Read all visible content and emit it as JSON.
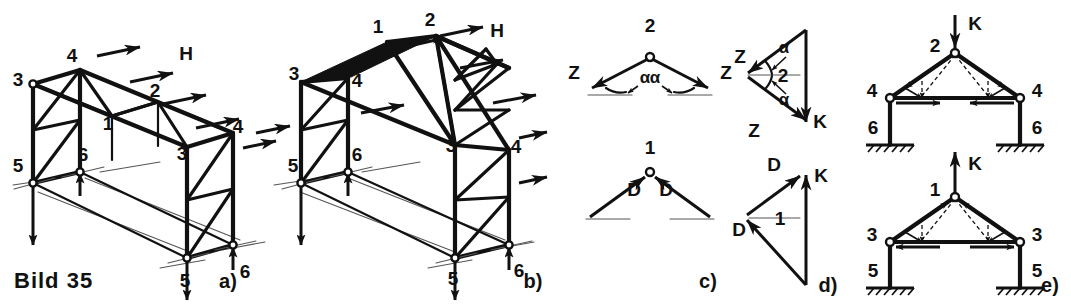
{
  "figure": {
    "caption": "Bild 35",
    "panel_labels": {
      "a": "a)",
      "b": "b)",
      "c": "c)",
      "d": "d)",
      "e": "e)"
    }
  },
  "panel_a": {
    "title": "Raeumliches Fachwerk mit Flachdach, Windlast H",
    "wind_label": "H",
    "node_labels": [
      {
        "text": "3",
        "x": 18,
        "y": 86
      },
      {
        "text": "4",
        "x": 72,
        "y": 62
      },
      {
        "text": "2",
        "x": 155,
        "y": 97
      },
      {
        "text": "1",
        "x": 108,
        "y": 130
      },
      {
        "text": "4",
        "x": 238,
        "y": 133
      },
      {
        "text": "3",
        "x": 182,
        "y": 160
      },
      {
        "text": "5",
        "x": 18,
        "y": 172
      },
      {
        "text": "6",
        "x": 83,
        "y": 161
      },
      {
        "text": "5",
        "x": 185,
        "y": 287
      },
      {
        "text": "6",
        "x": 245,
        "y": 278
      }
    ]
  },
  "panel_b": {
    "title": "Raeumliches Fachwerk mit Satteldach, Windlast H",
    "wind_label": "H",
    "node_labels": [
      {
        "text": "1",
        "x": 378,
        "y": 33
      },
      {
        "text": "2",
        "x": 430,
        "y": 26
      },
      {
        "text": "3",
        "x": 294,
        "y": 80
      },
      {
        "text": "4",
        "x": 357,
        "y": 87
      },
      {
        "text": "3",
        "x": 451,
        "y": 152
      },
      {
        "text": "4",
        "x": 513,
        "y": 153
      },
      {
        "text": "5",
        "x": 293,
        "y": 172
      },
      {
        "text": "6",
        "x": 357,
        "y": 161
      },
      {
        "text": "5",
        "x": 453,
        "y": 285
      },
      {
        "text": "6",
        "x": 516,
        "y": 277
      }
    ]
  },
  "panel_c": {
    "title": "Kraefte am Knoten",
    "top": {
      "node": "2",
      "force_left": "Z",
      "force_right": "Z",
      "angle_left": "α",
      "angle_right": "α"
    },
    "bottom": {
      "node": "1",
      "force_left": "D",
      "force_right": "D"
    }
  },
  "panel_d": {
    "title": "Krafteck",
    "top": {
      "force_z_upper": "Z",
      "force_z_lower": "Z",
      "load": "K",
      "angle_upper": "α",
      "angle_lower": "α",
      "inner_label": "2"
    },
    "bottom": {
      "force_d_upper": "D",
      "force_d_lower": "D",
      "load": "K",
      "inner_label": "1"
    }
  },
  "panel_e": {
    "title": "Ebener Rahmen, Kraft K am First",
    "top_frame": {
      "load": "K",
      "apex": "2",
      "eave_left": "4",
      "eave_right": "4",
      "base_left": "6",
      "base_right": "6"
    },
    "bottom_frame": {
      "load": "K",
      "apex": "1",
      "eave_left": "3",
      "eave_right": "3",
      "base_left": "5",
      "base_right": "5"
    }
  },
  "colors": {
    "ink": "#111111",
    "background": "#ffffff",
    "guide": "#777777"
  }
}
